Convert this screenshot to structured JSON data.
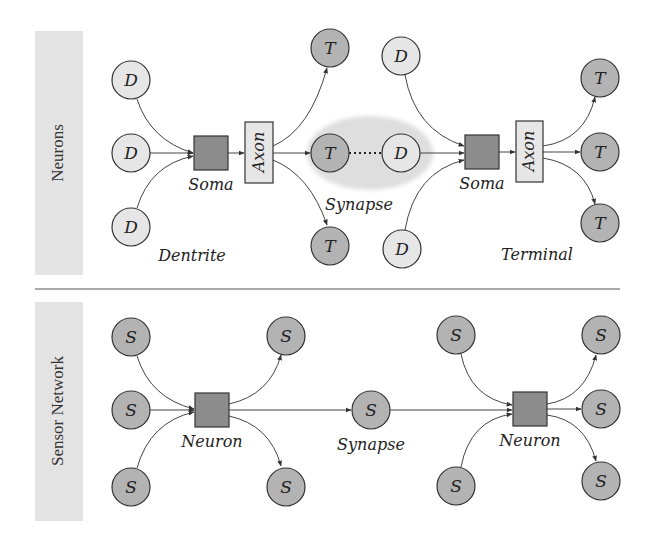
{
  "colors": {
    "dendrite_fill": "#e6e6e6",
    "terminal_fill": "#b3b3b3",
    "sensor_fill": "#b3b3b3",
    "soma_fill": "#8c8c8c",
    "axon_fill": "#e6e6e6",
    "panel_label_bg": "#e3e3e3",
    "synapse_halo": "#dcdcdc",
    "stroke": "#333333"
  },
  "panels": {
    "neurons": {
      "side_label": "Neurons",
      "node_letters": {
        "dendrite": "D",
        "terminal": "T"
      },
      "axon_label": "Axon",
      "labels": {
        "soma_left": "Soma",
        "soma_right": "Soma",
        "synapse": "Synapse",
        "dentrite": "Dentrite",
        "terminal": "Terminal"
      }
    },
    "sensor_network": {
      "side_label": "Sensor Network",
      "node_letter": "S",
      "labels": {
        "neuron_left": "Neuron",
        "neuron_right": "Neuron",
        "synapse": "Synapse"
      }
    }
  }
}
